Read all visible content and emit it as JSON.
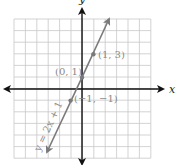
{
  "chart_data": {
    "type": "line",
    "title": "",
    "equation": "y = 2x + 1",
    "xlabel": "x",
    "ylabel": "y",
    "xlim": [
      -6,
      6
    ],
    "ylim": [
      -6,
      6
    ],
    "grid": true,
    "series": [
      {
        "name": "y = 2x + 1",
        "x": [
          -3.1,
          2.35
        ],
        "y": [
          -5.2,
          5.7
        ]
      }
    ],
    "points": [
      {
        "x": 1,
        "y": 3,
        "label": "(1, 3)"
      },
      {
        "x": 0,
        "y": 1,
        "label": "(0, 1)"
      },
      {
        "x": -1,
        "y": -1,
        "label": "(−1, −1)"
      }
    ]
  },
  "labels": {
    "x_axis": "x",
    "y_axis": "y",
    "equation": "y = 2x + 1",
    "p1": "(1, 3)",
    "p2": "(0, 1)",
    "p3": "(−1, −1)"
  },
  "colors": {
    "axis": "#111111",
    "grid": "#c8c8c8",
    "line": "#7a7a7a",
    "label": "#8a8a8a"
  }
}
